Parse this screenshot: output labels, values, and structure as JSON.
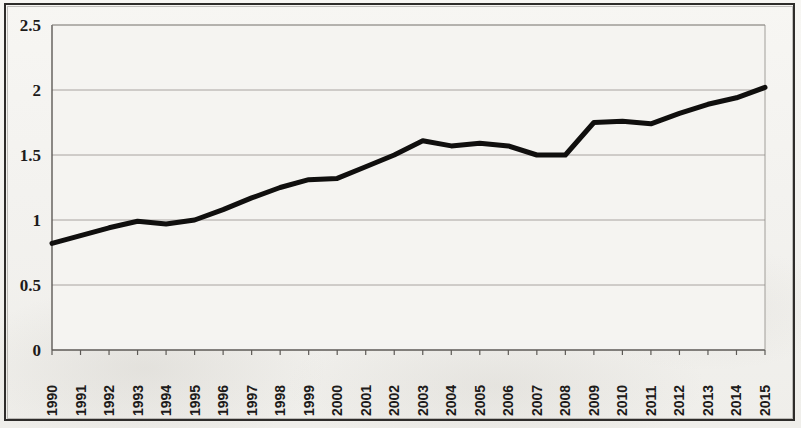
{
  "chart_data": {
    "type": "line",
    "title": "",
    "subtitle": "",
    "xlabel": "",
    "ylabel": "",
    "categories": [
      "1990",
      "1991",
      "1992",
      "1993",
      "1994",
      "1995",
      "1996",
      "1997",
      "1998",
      "1999",
      "2000",
      "2001",
      "2002",
      "2003",
      "2004",
      "2005",
      "2006",
      "2007",
      "2008",
      "2009",
      "2010",
      "2011",
      "2012",
      "2013",
      "2014",
      "2015"
    ],
    "values": [
      0.82,
      0.88,
      0.94,
      0.99,
      0.97,
      1.0,
      1.08,
      1.17,
      1.25,
      1.31,
      1.32,
      1.41,
      1.5,
      1.61,
      1.57,
      1.59,
      1.57,
      1.5,
      1.5,
      1.75,
      1.76,
      1.74,
      1.82,
      1.89,
      1.94,
      2.02
    ],
    "series": [
      {
        "name": "series-1",
        "color": "#100f0e",
        "values": [
          0.82,
          0.88,
          0.94,
          0.99,
          0.97,
          1.0,
          1.08,
          1.17,
          1.25,
          1.31,
          1.32,
          1.41,
          1.5,
          1.61,
          1.57,
          1.59,
          1.57,
          1.5,
          1.5,
          1.75,
          1.76,
          1.74,
          1.82,
          1.89,
          1.94,
          2.02
        ]
      }
    ],
    "ylim": [
      0,
      2.5
    ],
    "ytick_labels": [
      "0",
      "0.5",
      "1",
      "1.5",
      "2",
      "2.5"
    ],
    "ytick_values": [
      0,
      0.5,
      1,
      1.5,
      2,
      2.5
    ],
    "grid": true,
    "grid_axis": "y",
    "legend": false,
    "legend_position": "none",
    "markers": false,
    "line_width": 5
  },
  "style": {
    "background_color": "#f3f2ef",
    "plot_background_color": "#f5f4f1",
    "line_color": "#100f0e",
    "grid_color": "#8d8a85",
    "axis_color": "#5d5a56",
    "frame_color": "#2e2c2a",
    "text_color": "#1d1b1a"
  },
  "geometry": {
    "plot_left": 52,
    "plot_right": 765,
    "plot_top": 25,
    "plot_bottom": 350
  }
}
